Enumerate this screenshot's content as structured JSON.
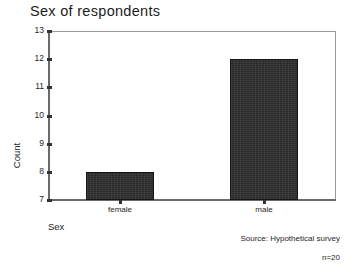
{
  "chart_data": {
    "type": "bar",
    "title": "Sex of respondents",
    "xlabel": "Sex",
    "ylabel": "Count",
    "categories": [
      "female",
      "male"
    ],
    "values": [
      8,
      12
    ],
    "ylim": [
      7,
      13
    ],
    "yticks": [
      13,
      12,
      11,
      10,
      9,
      8,
      7
    ],
    "ytick_labels": [
      "13",
      "12",
      "11",
      "10",
      "9",
      "8",
      "7"
    ],
    "grid": false,
    "legend": null,
    "bar_color": "#2b2b2b",
    "frame_color": "#9a9a9a",
    "annotations": [
      "Source: Hypothetical survey",
      "n=20"
    ]
  },
  "footnotes": {
    "source": "Source: Hypothetical survey",
    "sample_size": "n=20"
  }
}
